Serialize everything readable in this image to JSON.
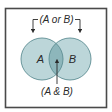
{
  "diagram": {
    "type": "venn",
    "sets": [
      {
        "id": "A",
        "label": "A"
      },
      {
        "id": "B",
        "label": "B"
      }
    ],
    "union_label": "(A or B)",
    "intersection_label": "(A & B)",
    "colors": {
      "frame": "#4a4a4a",
      "circle_fill": "#bcd6d9",
      "intersection_fill": "#8db6bb",
      "circle_stroke": "#5d8d93",
      "arrow": "#2a2a2a",
      "text": "#2a2a2a"
    }
  }
}
